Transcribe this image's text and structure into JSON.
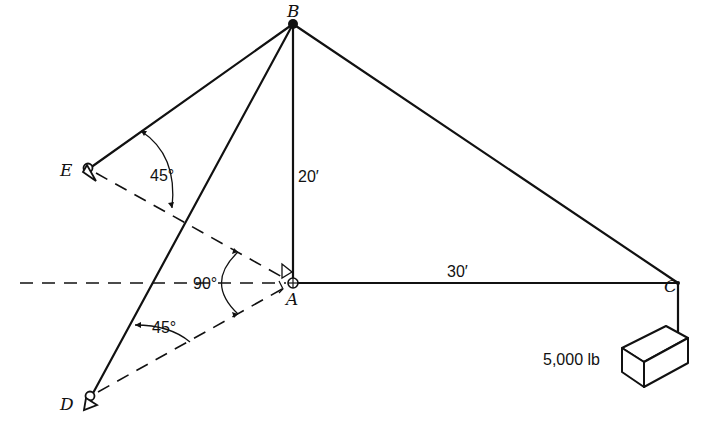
{
  "diagram": {
    "type": "boom-and-cable structure (statics)",
    "points": {
      "A": {
        "label": "A",
        "x": 293,
        "y": 283
      },
      "B": {
        "label": "B",
        "x": 293,
        "y": 24
      },
      "C": {
        "label": "C",
        "x": 678,
        "y": 283
      },
      "D": {
        "label": "D",
        "x": 90,
        "y": 397
      },
      "E": {
        "label": "E",
        "x": 88,
        "y": 168
      }
    },
    "dimensions": {
      "AB": "20′",
      "AC": "30′"
    },
    "angles": {
      "EBA_cable_angle": "45°",
      "DEA_between_ground_lines": "90°",
      "D_cable_angle": "45°"
    },
    "load": {
      "label": "5,000 lb"
    },
    "colors": {
      "ink": "#111111",
      "background": "#ffffff"
    }
  }
}
